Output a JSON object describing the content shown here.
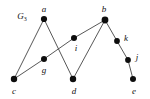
{
  "figure": {
    "title_label": "G",
    "title_subscript": "3",
    "title_x": 22,
    "title_y": 17,
    "width": 150,
    "height": 99,
    "background_color": "#ffffff",
    "edge_color": "#444444",
    "vertex_color": "#0d0d0d"
  },
  "graph_data": {
    "type": "node-link-diagram",
    "vertices": [
      {
        "id": "a",
        "label": "a",
        "x": 44,
        "y": 19,
        "r": 3.1,
        "label_x": 44,
        "label_y": 9
      },
      {
        "id": "b",
        "label": "b",
        "x": 105,
        "y": 20,
        "r": 3.4,
        "label_x": 104,
        "label_y": 9
      },
      {
        "id": "c",
        "label": "c",
        "x": 14,
        "y": 79,
        "r": 3.2,
        "label_x": 14,
        "label_y": 91
      },
      {
        "id": "d",
        "label": "d",
        "x": 73,
        "y": 79,
        "r": 3.2,
        "label_x": 74,
        "label_y": 91
      },
      {
        "id": "e",
        "label": "e",
        "x": 133,
        "y": 79,
        "r": 3.0,
        "label_x": 134,
        "label_y": 91
      },
      {
        "id": "g",
        "label": "g",
        "x": 44,
        "y": 59,
        "r": 3.0,
        "label_x": 44,
        "label_y": 70
      },
      {
        "id": "i",
        "label": "i",
        "x": 74,
        "y": 38,
        "r": 3.0,
        "label_x": 76,
        "label_y": 48
      },
      {
        "id": "k",
        "label": "k",
        "x": 117,
        "y": 41,
        "r": 2.9,
        "label_x": 126,
        "label_y": 38
      },
      {
        "id": "j",
        "label": "j",
        "x": 128,
        "y": 60,
        "r": 2.9,
        "label_x": 137,
        "label_y": 57
      }
    ],
    "edges": [
      {
        "id": "a-c",
        "from": "a",
        "to": "c"
      },
      {
        "id": "a-d",
        "from": "a",
        "to": "d"
      },
      {
        "id": "c-g",
        "from": "c",
        "to": "g"
      },
      {
        "id": "g-i",
        "from": "g",
        "to": "i"
      },
      {
        "id": "i-b",
        "from": "i",
        "to": "b"
      },
      {
        "id": "d-b",
        "from": "d",
        "to": "b"
      },
      {
        "id": "b-k",
        "from": "b",
        "to": "k"
      },
      {
        "id": "k-j",
        "from": "k",
        "to": "j"
      },
      {
        "id": "j-e",
        "from": "j",
        "to": "e"
      }
    ]
  }
}
